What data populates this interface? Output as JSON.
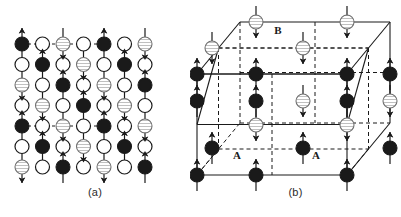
{
  "figure": {
    "background_color": "#ffffff",
    "ink_color": "#1a1a1a",
    "hatch_color": "#8c8c8c",
    "open_fill": "#ffffff"
  },
  "panels": [
    {
      "id": "a",
      "caption": "(a)",
      "description": "Two-dimensional projection of the antiferromagnetic lattice",
      "grid": {
        "rows": 7,
        "cols": 7,
        "x0": 22,
        "y0": 44,
        "dx": 20.5,
        "dy": 20.5,
        "radius": 7.0
      },
      "site_types_legend": {
        "filled": "magnetic ion, spin up (sublattice A)",
        "hatched": "magnetic ion, spin down (sublattice B)",
        "open": "non-magnetic ion"
      },
      "cells": [
        [
          "filled",
          "open",
          "hatched",
          "open",
          "filled",
          "open",
          "hatched"
        ],
        [
          "open",
          "filled",
          "open",
          "hatched",
          "open",
          "filled",
          "open"
        ],
        [
          "hatched",
          "open",
          "filled",
          "open",
          "hatched",
          "open",
          "filled"
        ],
        [
          "open",
          "hatched",
          "open",
          "filled",
          "open",
          "hatched",
          "open"
        ],
        [
          "filled",
          "open",
          "hatched",
          "open",
          "filled",
          "open",
          "hatched"
        ],
        [
          "open",
          "filled",
          "open",
          "hatched",
          "open",
          "filled",
          "open"
        ],
        [
          "hatched",
          "open",
          "filled",
          "open",
          "hatched",
          "open",
          "filled"
        ]
      ],
      "spins": [
        [
          "up",
          "none",
          "down",
          "none",
          "up",
          "none",
          "down"
        ],
        [
          "none",
          "up",
          "none",
          "down",
          "none",
          "up",
          "none"
        ],
        [
          "down",
          "none",
          "up",
          "none",
          "down",
          "none",
          "up"
        ],
        [
          "none",
          "down",
          "none",
          "up",
          "none",
          "down",
          "none"
        ],
        [
          "up",
          "none",
          "down",
          "none",
          "up",
          "none",
          "down"
        ],
        [
          "none",
          "up",
          "none",
          "down",
          "none",
          "up",
          "none"
        ],
        [
          "down",
          "none",
          "up",
          "none",
          "down",
          "none",
          "up"
        ]
      ],
      "dashed_connector_rows": [
        0,
        4
      ],
      "dashed_connector_span": [
        0,
        4
      ]
    },
    {
      "id": "b",
      "caption": "(b)",
      "description": "Three-dimensional cubic unit cell showing A and B sublattices",
      "labels": [
        {
          "text": "B",
          "x": 88,
          "y": 34
        },
        {
          "text": "A",
          "x": 47,
          "y": 159
        },
        {
          "text": "A",
          "x": 126,
          "y": 159
        }
      ],
      "sublattices": {
        "A": "filled circles, spin up",
        "B": "hatched circles, spin down"
      },
      "atoms": [
        {
          "x": 66,
          "y": 22,
          "type": "hatched",
          "spin": "down"
        },
        {
          "x": 157,
          "y": 22,
          "type": "hatched",
          "spin": "down"
        },
        {
          "x": 22,
          "y": 48,
          "type": "hatched",
          "spin": "down"
        },
        {
          "x": 113,
          "y": 48,
          "type": "hatched",
          "spin": "down"
        },
        {
          "x": 7,
          "y": 74,
          "type": "filled",
          "spin": "up"
        },
        {
          "x": 66,
          "y": 74,
          "type": "filled",
          "spin": "up"
        },
        {
          "x": 157,
          "y": 74,
          "type": "filled",
          "spin": "up"
        },
        {
          "x": 200,
          "y": 74,
          "type": "filled",
          "spin": "up"
        },
        {
          "x": 7,
          "y": 101,
          "type": "filled",
          "spin": "up"
        },
        {
          "x": 66,
          "y": 101,
          "type": "filled",
          "spin": "up"
        },
        {
          "x": 113,
          "y": 101,
          "type": "hatched",
          "spin": "down"
        },
        {
          "x": 157,
          "y": 101,
          "type": "filled",
          "spin": "up"
        },
        {
          "x": 200,
          "y": 101,
          "type": "hatched",
          "spin": "down"
        },
        {
          "x": 66,
          "y": 125,
          "type": "hatched",
          "spin": "down"
        },
        {
          "x": 157,
          "y": 125,
          "type": "hatched",
          "spin": "down"
        },
        {
          "x": 22,
          "y": 148,
          "type": "filled",
          "spin": "up"
        },
        {
          "x": 113,
          "y": 148,
          "type": "filled",
          "spin": "up"
        },
        {
          "x": 200,
          "y": 148,
          "type": "filled",
          "spin": "up"
        },
        {
          "x": 7,
          "y": 175,
          "type": "filled",
          "spin": "up"
        },
        {
          "x": 66,
          "y": 175,
          "type": "filled",
          "spin": "up"
        },
        {
          "x": 157,
          "y": 175,
          "type": "filled",
          "spin": "up"
        }
      ]
    }
  ]
}
